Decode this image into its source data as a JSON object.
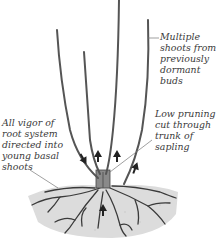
{
  "diagram": {
    "labels": {
      "top_right": "Multiple\nshoots from\npreviously\ndormant\nbuds",
      "mid_right": "Low pruning\ncut through\ntrunk of\nsapling",
      "left": "All vigor of\nroot system\ndirected into\nyoung basal\nshoots"
    },
    "colors": {
      "stem": "#555555",
      "soil": "#d9d9d9",
      "roots": "#3a3a3a",
      "text": "#3a3a3a",
      "arrows": "#222222"
    },
    "arrows": 5
  }
}
